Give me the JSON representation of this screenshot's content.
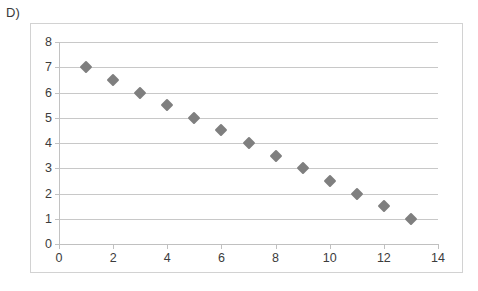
{
  "panel": {
    "label": "D)"
  },
  "chart_data": {
    "type": "scatter",
    "title": "",
    "subtitle": "",
    "xlabel": "",
    "ylabel": "",
    "xlim": [
      0,
      14
    ],
    "ylim": [
      0,
      8
    ],
    "grid": true,
    "grid_axis": "y",
    "legend": false,
    "legend_position": "none",
    "marker": "diamond",
    "marker_color": "#7f7f7f",
    "gridline_color": "#c8c8c8",
    "axis_text_color": "#3c3c3c",
    "x_ticks": [
      0,
      2,
      4,
      6,
      8,
      10,
      12,
      14
    ],
    "y_ticks": [
      0,
      1,
      2,
      3,
      4,
      5,
      6,
      7,
      8
    ],
    "x_tick_labels": [
      "0",
      "2",
      "4",
      "6",
      "8",
      "10",
      "12",
      "14"
    ],
    "y_tick_labels": [
      "0",
      "1",
      "2",
      "3",
      "4",
      "5",
      "6",
      "7",
      "8"
    ],
    "x": [
      1,
      2,
      3,
      4,
      5,
      6,
      7,
      8,
      9,
      10,
      11,
      12,
      13
    ],
    "y": [
      7,
      6.5,
      6,
      5.5,
      5,
      4.5,
      4,
      3.5,
      3,
      2.5,
      2,
      1.5,
      1
    ],
    "points": [
      {
        "x": 1,
        "y": 7
      },
      {
        "x": 2,
        "y": 6.5
      },
      {
        "x": 3,
        "y": 6
      },
      {
        "x": 4,
        "y": 5.5
      },
      {
        "x": 5,
        "y": 5
      },
      {
        "x": 6,
        "y": 4.5
      },
      {
        "x": 7,
        "y": 4
      },
      {
        "x": 8,
        "y": 3.5
      },
      {
        "x": 9,
        "y": 3
      },
      {
        "x": 10,
        "y": 2.5
      },
      {
        "x": 11,
        "y": 2
      },
      {
        "x": 12,
        "y": 1.5
      },
      {
        "x": 13,
        "y": 1
      }
    ]
  }
}
